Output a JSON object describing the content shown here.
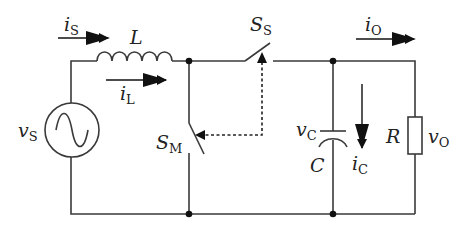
{
  "diagram": {
    "type": "circuit-schematic",
    "colors": {
      "wire": "#3a3a3a",
      "arrow": "#111111",
      "background": "#ffffff"
    },
    "components": {
      "source": {
        "name": "v",
        "sub": "S"
      },
      "inductor": {
        "name": "L"
      },
      "main_switch": {
        "name": "S",
        "sub": "M"
      },
      "series_switch": {
        "name": "S",
        "sub": "S"
      },
      "capacitor": {
        "name": "C",
        "voltage": "v",
        "voltage_sub": "C"
      },
      "resistor": {
        "name": "R",
        "voltage": "v",
        "voltage_sub": "O"
      }
    },
    "currents": {
      "source_current": {
        "name": "i",
        "sub": "S"
      },
      "inductor_current": {
        "name": "i",
        "sub": "L"
      },
      "output_current": {
        "name": "i",
        "sub": "O"
      },
      "capacitor_current": {
        "name": "i",
        "sub": "C"
      }
    }
  }
}
